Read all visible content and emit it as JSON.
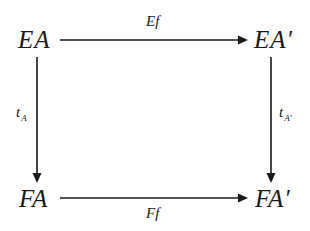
{
  "diagram": {
    "type": "commutative-square",
    "nodes": {
      "top_left": "EA",
      "top_right": "EA′",
      "bottom_left": "FA",
      "bottom_right": "FA′"
    },
    "arrows": {
      "top": {
        "label": "Ef",
        "from": "EA",
        "to": "EA′"
      },
      "bottom": {
        "label": "Ff",
        "from": "FA",
        "to": "FA′"
      },
      "left": {
        "label_main": "t",
        "label_sub": "A",
        "from": "EA",
        "to": "FA"
      },
      "right": {
        "label_main": "t",
        "label_sub": "A′",
        "from": "EA′",
        "to": "FA′"
      }
    },
    "colors": {
      "ink": "#1a1a1a",
      "background": "#ffffff"
    }
  }
}
